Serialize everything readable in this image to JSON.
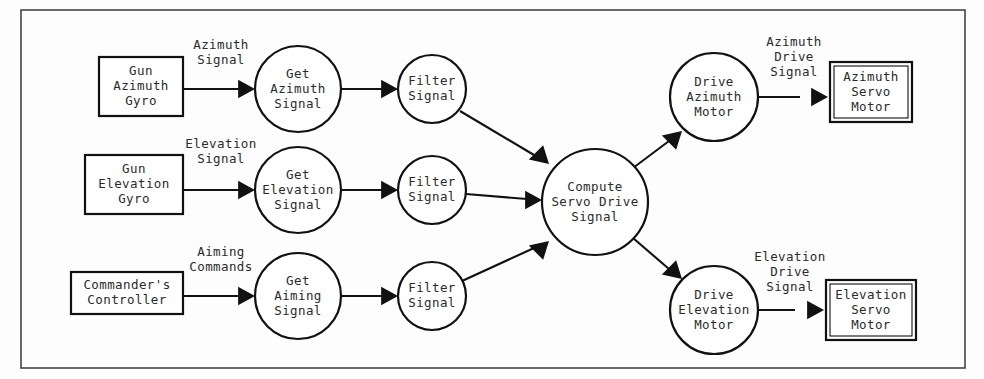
{
  "diagram": {
    "type": "data-flow-diagram",
    "frame": {
      "x": 21,
      "y": 10,
      "width": 944,
      "height": 358
    },
    "external_entities": [
      {
        "id": "gun-azimuth-gyro",
        "lines": [
          "Gun",
          "Azimuth",
          "Gyro"
        ],
        "shape": "rectangle",
        "double_border": false,
        "x": 99,
        "y": 57,
        "width": 84,
        "height": 59
      },
      {
        "id": "gun-elevation-gyro",
        "lines": [
          "Gun",
          "Elevation",
          "Gyro"
        ],
        "shape": "rectangle",
        "double_border": false,
        "x": 85,
        "y": 155,
        "width": 98,
        "height": 59
      },
      {
        "id": "commanders-controller",
        "lines": [
          "Commander's",
          "Controller"
        ],
        "shape": "rectangle",
        "double_border": false,
        "x": 71,
        "y": 272,
        "width": 112,
        "height": 42
      },
      {
        "id": "azimuth-servo-motor",
        "lines": [
          "Azimuth",
          "Servo",
          "Motor"
        ],
        "shape": "rectangle",
        "double_border": true,
        "x": 830,
        "y": 62,
        "width": 82,
        "height": 60
      },
      {
        "id": "elevation-servo-motor",
        "lines": [
          "Elevation",
          "Servo",
          "Motor"
        ],
        "shape": "rectangle",
        "double_border": true,
        "x": 826,
        "y": 280,
        "width": 90,
        "height": 60
      }
    ],
    "processes": [
      {
        "id": "get-azimuth-signal",
        "lines": [
          "Get",
          "Azimuth",
          "Signal"
        ],
        "shape": "circle",
        "cx": 298,
        "cy": 89,
        "r": 43
      },
      {
        "id": "filter-signal-azimuth",
        "lines": [
          "Filter",
          "Signal"
        ],
        "shape": "circle",
        "cx": 432,
        "cy": 89,
        "r": 34
      },
      {
        "id": "get-elevation-signal",
        "lines": [
          "Get",
          "Elevation",
          "Signal"
        ],
        "shape": "circle",
        "cx": 298,
        "cy": 190,
        "r": 43
      },
      {
        "id": "filter-signal-elevation",
        "lines": [
          "Filter",
          "Signal"
        ],
        "shape": "circle",
        "cx": 432,
        "cy": 190,
        "r": 34
      },
      {
        "id": "get-aiming-signal",
        "lines": [
          "Get",
          "Aiming",
          "Signal"
        ],
        "shape": "circle",
        "cx": 298,
        "cy": 296,
        "r": 43
      },
      {
        "id": "filter-signal-aiming",
        "lines": [
          "Filter",
          "Signal"
        ],
        "shape": "circle",
        "cx": 432,
        "cy": 296,
        "r": 34
      },
      {
        "id": "compute-servo-drive-signal",
        "lines": [
          "Compute",
          "Servo Drive",
          "Signal"
        ],
        "shape": "circle",
        "cx": 595,
        "cy": 202,
        "r": 53
      },
      {
        "id": "drive-azimuth-motor",
        "lines": [
          "Drive",
          "Azimuth",
          "Motor"
        ],
        "shape": "circle",
        "cx": 714,
        "cy": 97,
        "r": 44
      },
      {
        "id": "drive-elevation-motor",
        "lines": [
          "Drive",
          "Elevation",
          "Motor"
        ],
        "shape": "circle",
        "cx": 714,
        "cy": 310,
        "r": 44
      }
    ],
    "flows": [
      {
        "id": "azimuth-signal",
        "label_lines": [
          "Azimuth",
          "Signal"
        ],
        "label_x": 221,
        "label_y": 53,
        "from": "gun-azimuth-gyro",
        "to": "get-azimuth-signal",
        "path": "M 183 89 L 240 89",
        "arrow": "right",
        "ax": 255,
        "ay": 89
      },
      {
        "id": "azimuth-to-filter",
        "label_lines": [],
        "from": "get-azimuth-signal",
        "to": "filter-signal-azimuth",
        "path": "M 341 89 L 383 89",
        "arrow": "right",
        "ax": 398,
        "ay": 89
      },
      {
        "id": "filtered-azimuth-to-compute",
        "label_lines": [],
        "from": "filter-signal-azimuth",
        "to": "compute-servo-drive-signal",
        "path": "M 460 111 L 534 155",
        "arrow": "diag-dr",
        "ax": 549,
        "ay": 164
      },
      {
        "id": "elevation-signal",
        "label_lines": [
          "Elevation",
          "Signal"
        ],
        "label_x": 221,
        "label_y": 152,
        "from": "gun-elevation-gyro",
        "to": "get-elevation-signal",
        "path": "M 183 190 L 240 190",
        "arrow": "right",
        "ax": 255,
        "ay": 190
      },
      {
        "id": "elevation-to-filter",
        "label_lines": [],
        "from": "get-elevation-signal",
        "to": "filter-signal-elevation",
        "path": "M 341 190 L 383 190",
        "arrow": "right",
        "ax": 398,
        "ay": 190
      },
      {
        "id": "filtered-elevation-to-compute",
        "label_lines": [],
        "from": "filter-signal-elevation",
        "to": "compute-servo-drive-signal",
        "path": "M 466 194 L 527 199",
        "arrow": "right",
        "ax": 542,
        "ay": 200
      },
      {
        "id": "aiming-commands",
        "label_lines": [
          "Aiming",
          "Commands"
        ],
        "label_x": 221,
        "label_y": 260,
        "from": "commanders-controller",
        "to": "get-aiming-signal",
        "path": "M 183 296 L 240 296",
        "arrow": "right",
        "ax": 255,
        "ay": 296
      },
      {
        "id": "aiming-to-filter",
        "label_lines": [],
        "from": "get-aiming-signal",
        "to": "filter-signal-aiming",
        "path": "M 341 296 L 383 296",
        "arrow": "right",
        "ax": 398,
        "ay": 296
      },
      {
        "id": "filtered-aiming-to-compute",
        "label_lines": [],
        "from": "filter-signal-aiming",
        "to": "compute-servo-drive-signal",
        "path": "M 462 281 L 534 248",
        "arrow": "diag-ur",
        "ax": 549,
        "ay": 241
      },
      {
        "id": "compute-to-drive-azimuth",
        "label_lines": [],
        "from": "compute-servo-drive-signal",
        "to": "drive-azimuth-motor",
        "path": "M 633 168 L 669 141",
        "arrow": "diag-ur",
        "ax": 682,
        "ay": 131
      },
      {
        "id": "compute-to-drive-elevation",
        "label_lines": [],
        "from": "compute-servo-drive-signal",
        "to": "drive-elevation-motor",
        "path": "M 633 238 L 669 269",
        "arrow": "diag-dr",
        "ax": 682,
        "ay": 279
      },
      {
        "id": "azimuth-drive-signal",
        "label_lines": [
          "Azimuth",
          "Drive",
          "Signal"
        ],
        "label_x": 794,
        "label_y": 57,
        "from": "drive-azimuth-motor",
        "to": "azimuth-servo-motor",
        "path": "M 758 97 L 800 97",
        "arrow": "right",
        "ax": 828,
        "ay": 97
      },
      {
        "id": "elevation-drive-signal",
        "label_lines": [
          "Elevation",
          "Drive",
          "Signal"
        ],
        "label_x": 790,
        "label_y": 272,
        "from": "drive-elevation-motor",
        "to": "elevation-servo-motor",
        "path": "M 758 310 L 795 310",
        "arrow": "right",
        "ax": 824,
        "ay": 310
      }
    ]
  }
}
